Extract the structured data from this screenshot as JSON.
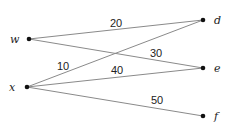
{
  "diagram": {
    "type": "bipartite-weighted-graph",
    "nodes": [
      {
        "id": "w",
        "label": "w",
        "x": 29,
        "y": 39,
        "lx": 10,
        "ly": 43
      },
      {
        "id": "x",
        "label": "x",
        "x": 27,
        "y": 87,
        "lx": 9,
        "ly": 91
      },
      {
        "id": "d",
        "label": "d",
        "x": 203,
        "y": 20,
        "lx": 214,
        "ly": 24
      },
      {
        "id": "e",
        "label": "e",
        "x": 203,
        "y": 68,
        "lx": 214,
        "ly": 72
      },
      {
        "id": "f",
        "label": "f",
        "x": 203,
        "y": 116,
        "lx": 214,
        "ly": 120
      }
    ],
    "edges": [
      {
        "from": "w",
        "to": "d",
        "weight": "20",
        "lx": 110,
        "ly": 27
      },
      {
        "from": "w",
        "to": "e",
        "weight": "30",
        "lx": 150,
        "ly": 57
      },
      {
        "from": "x",
        "to": "d",
        "weight": "10",
        "lx": 57,
        "ly": 70
      },
      {
        "from": "x",
        "to": "e",
        "weight": "40",
        "lx": 111,
        "ly": 74
      },
      {
        "from": "x",
        "to": "f",
        "weight": "50",
        "lx": 151,
        "ly": 104
      }
    ]
  }
}
